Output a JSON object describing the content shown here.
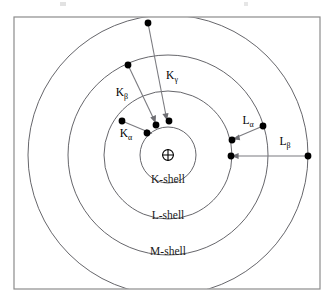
{
  "figure": {
    "nucleus_symbol": "⊕",
    "nucleus_name": "nucleus-plus-symbol"
  },
  "colors": {
    "frame_border": "#8c8c8c",
    "shell_stroke": "#55555a",
    "electron_fill": "#000000",
    "arrow_stroke": "#7b7b80",
    "label_fill": "#1a1a1a",
    "background": "#ffffff"
  },
  "geometry": {
    "center_x": 168,
    "center_y": 155,
    "frame": {
      "x": 14,
      "y": 17,
      "width": 306,
      "height": 272
    },
    "shell_radii": [
      28,
      64,
      100,
      140
    ]
  },
  "shells": [
    {
      "id": "k",
      "label": "K-shell",
      "radius": 28,
      "label_x": 168,
      "label_y": 183
    },
    {
      "id": "l",
      "label": "L-shell",
      "radius": 64,
      "label_x": 168,
      "label_y": 219
    },
    {
      "id": "m",
      "label": "M-shell",
      "radius": 100,
      "label_x": 168,
      "label_y": 255
    },
    {
      "id": "n",
      "label": "",
      "radius": 140,
      "label_x": 168,
      "label_y": 295
    }
  ],
  "transitions": [
    {
      "id": "k-alpha",
      "label_base": "K",
      "label_sub": "α",
      "label_x": 126,
      "label_y": 137,
      "from_shell": "l",
      "to_shell": "k",
      "from_x": 122,
      "from_y": 121,
      "to_x": 147,
      "to_y": 132
    },
    {
      "id": "k-beta",
      "label_base": "K",
      "label_sub": "β",
      "label_x": 122,
      "label_y": 96,
      "from_shell": "m",
      "to_shell": "k",
      "from_x": 128,
      "from_y": 65,
      "to_x": 155,
      "to_y": 124
    },
    {
      "id": "k-gamma",
      "label_base": "K",
      "label_sub": "γ",
      "label_x": 172,
      "label_y": 79,
      "from_shell": "n",
      "to_shell": "k",
      "from_x": 148,
      "from_y": 23,
      "to_x": 167,
      "to_y": 122
    },
    {
      "id": "l-alpha",
      "label_base": "L",
      "label_sub": "α",
      "label_x": 248,
      "label_y": 124,
      "from_shell": "m",
      "to_shell": "l",
      "from_x": 263,
      "from_y": 126,
      "to_x": 233,
      "to_y": 139
    },
    {
      "id": "l-beta",
      "label_base": "L",
      "label_sub": "β",
      "label_x": 285,
      "label_y": 145,
      "from_shell": "n",
      "to_shell": "l",
      "from_x": 308,
      "from_y": 156,
      "to_x": 231,
      "to_y": 156
    }
  ],
  "electrons": [
    {
      "id": "e-l-kalpha-source",
      "x": 122,
      "y": 121
    },
    {
      "id": "e-k-kalpha-target",
      "x": 147,
      "y": 133
    },
    {
      "id": "e-m-kbeta-source",
      "x": 128,
      "y": 65
    },
    {
      "id": "e-k-kbeta-target",
      "x": 156,
      "y": 125
    },
    {
      "id": "e-n-kgamma-source",
      "x": 148,
      "y": 23
    },
    {
      "id": "e-k-kgamma-target",
      "x": 169,
      "y": 121
    },
    {
      "id": "e-m-lalpha-source",
      "x": 263,
      "y": 126
    },
    {
      "id": "e-l-lalpha-target",
      "x": 232,
      "y": 140
    },
    {
      "id": "e-n-lbeta-source",
      "x": 308,
      "y": 156
    },
    {
      "id": "e-l-lbeta-target",
      "x": 231,
      "y": 156
    }
  ]
}
